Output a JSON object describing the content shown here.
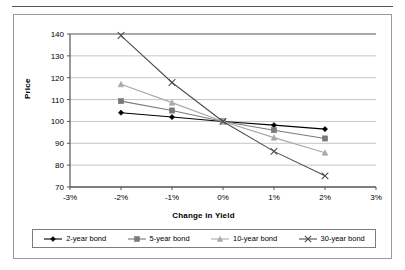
{
  "chart_data": {
    "type": "line",
    "title": "",
    "xlabel": "Change in Yield",
    "ylabel": "Price",
    "x": [
      -2,
      -1,
      0,
      1,
      2
    ],
    "xtick_labels": [
      "-3%",
      "-2%",
      "-1%",
      "0%",
      "1%",
      "2%",
      "3%"
    ],
    "xtick_values": [
      -3,
      -2,
      -1,
      0,
      1,
      2,
      3
    ],
    "ytick_labels": [
      "70",
      "80",
      "90",
      "100",
      "110",
      "120",
      "130",
      "140"
    ],
    "ytick_values": [
      70,
      80,
      90,
      100,
      110,
      120,
      130,
      140
    ],
    "xlim": [
      -3,
      3
    ],
    "ylim": [
      70,
      140
    ],
    "grid": "horizontal",
    "legend_position": "bottom",
    "series": [
      {
        "name": "2-year bond",
        "marker": "diamond",
        "color": "#000000",
        "x": [
          -2,
          -1,
          0,
          1,
          2
        ],
        "values": [
          104.0,
          102.0,
          100.0,
          98.3,
          96.5
        ]
      },
      {
        "name": "5-year bond",
        "marker": "square",
        "color": "#7a7a7a",
        "x": [
          -2,
          -1,
          0,
          1,
          2
        ],
        "values": [
          109.3,
          105.0,
          100.0,
          96.0,
          92.2
        ]
      },
      {
        "name": "10-year bond",
        "marker": "triangle",
        "color": "#a9a9a9",
        "x": [
          -2,
          -1,
          0,
          1,
          2
        ],
        "values": [
          117.0,
          108.6,
          100.0,
          92.6,
          85.7
        ]
      },
      {
        "name": "30-year bond",
        "marker": "cross-x",
        "color": "#4d4d4d",
        "x": [
          -2,
          -1,
          0,
          1,
          2
        ],
        "values": [
          139.3,
          117.8,
          100.0,
          86.3,
          75.1
        ]
      }
    ]
  },
  "legend": {
    "items": [
      {
        "label": "2-year bond",
        "marker": "diamond",
        "color": "#000000"
      },
      {
        "label": "5-year bond",
        "marker": "square",
        "color": "#7a7a7a"
      },
      {
        "label": "10-year bond",
        "marker": "triangle",
        "color": "#a9a9a9"
      },
      {
        "label": "30-year bond",
        "marker": "cross-x",
        "color": "#4d4d4d"
      }
    ]
  },
  "colors": {
    "frame": "#9b9b9b",
    "axis": "#555555",
    "grid": "#b8b8b8",
    "background": "#ffffff"
  }
}
